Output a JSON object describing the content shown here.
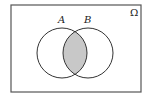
{
  "diagram": {
    "type": "venn",
    "universe_label": "Ω",
    "sets": [
      {
        "label": "A"
      },
      {
        "label": "B"
      }
    ],
    "shaded_region": "A ∩ B",
    "colors": {
      "stroke": "#333333",
      "shade": "#c8c8c8",
      "background": "#ffffff"
    }
  }
}
